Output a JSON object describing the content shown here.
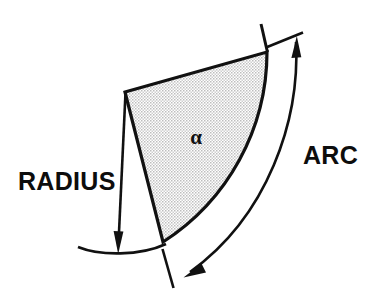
{
  "diagram": {
    "background_color": "#ffffff",
    "ink_color": "#111111",
    "sector_fill_color": "#d9d9d9",
    "labels": {
      "radius": "RADIUS",
      "arc": "ARC",
      "angle_symbol": "α"
    },
    "shapes": {
      "sector": {
        "name": "shaded-circular-sector",
        "apex": [
          125,
          92
        ],
        "corner_top_right": [
          267,
          52
        ],
        "corner_bottom_left": [
          163,
          242
        ],
        "fill": "#d9d9d9",
        "stroke": "#111111"
      },
      "radius_dimension": {
        "name": "radius-dimension-line",
        "from": [
          125,
          92
        ],
        "to": [
          118,
          250
        ],
        "arrow_at": "to",
        "arrow_direction": "down"
      },
      "radius_tick_arc": {
        "name": "radius-extension-arc",
        "from": [
          78,
          248
        ],
        "through": [
          118,
          255
        ],
        "to": [
          164,
          245
        ]
      },
      "arc_dimension": {
        "name": "arc-dimension-curve",
        "from": [
          297,
          38
        ],
        "to": [
          186,
          277
        ],
        "arrow_at_start": "up",
        "arrow_at_end": "down-left"
      },
      "top_extension_line": {
        "name": "top-extension-line",
        "from": [
          267,
          47
        ],
        "to": [
          302,
          33
        ]
      },
      "bottom_extension_line": {
        "name": "bottom-extension-line",
        "from": [
          163,
          249
        ],
        "to": [
          173,
          288
        ]
      },
      "sector_outer_arc_overshoot": {
        "name": "sector-arc-overshoot",
        "from": [
          262,
          26
        ],
        "to": [
          267,
          52
        ]
      }
    },
    "label_positions": {
      "radius": [
        20,
        190
      ],
      "arc": [
        303,
        163
      ],
      "alpha": [
        196,
        137
      ]
    }
  }
}
